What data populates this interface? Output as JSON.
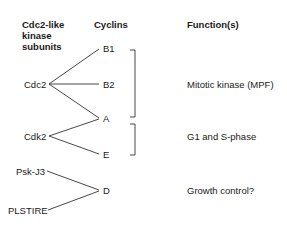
{
  "headers": {
    "kinases": [
      "Cdc2-like",
      "kinase",
      "subunits"
    ],
    "cyclins": "Cyclins",
    "functions": "Function(s)"
  },
  "kinases": [
    "Cdc2",
    "Cdk2",
    "Psk-J3",
    "PLSTIRE"
  ],
  "cyclins": [
    "B1",
    "B2",
    "A",
    "E",
    "D"
  ],
  "functions": [
    "Mitotic kinase (MPF)",
    "G1 and S-phase",
    "Growth control?"
  ],
  "links": [
    {
      "kinase": "Cdc2",
      "cyclin": "B1"
    },
    {
      "kinase": "Cdc2",
      "cyclin": "B2"
    },
    {
      "kinase": "Cdc2",
      "cyclin": "A"
    },
    {
      "kinase": "Cdk2",
      "cyclin": "A"
    },
    {
      "kinase": "Cdk2",
      "cyclin": "E"
    },
    {
      "kinase": "Psk-J3",
      "cyclin": "D"
    },
    {
      "kinase": "PLSTIRE",
      "cyclin": "D"
    }
  ],
  "groups": [
    {
      "cyclins": [
        "B1",
        "B2",
        "A"
      ],
      "function": "Mitotic kinase (MPF)"
    },
    {
      "cyclins": [
        "A",
        "E"
      ],
      "function": "G1 and S-phase"
    },
    {
      "cyclins": [
        "D"
      ],
      "function": "Growth control?"
    }
  ]
}
